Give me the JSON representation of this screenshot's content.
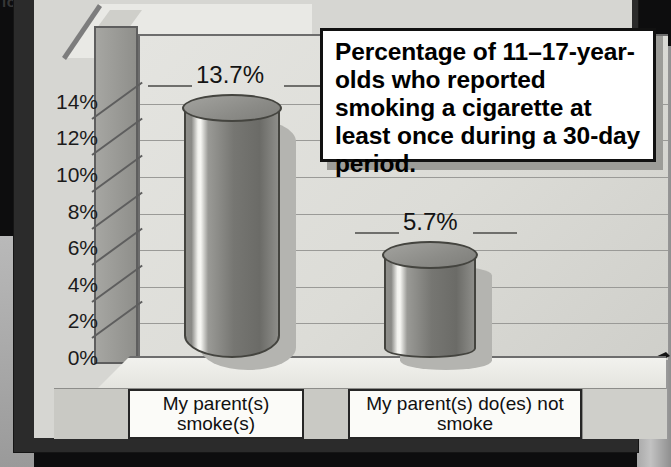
{
  "figure": {
    "cropped_text_fragment": "ion",
    "callout_title": "Percentage of 11–17-year-olds who reported smoking a cigarette at least once during a 30-day period."
  },
  "chart_data": {
    "type": "bar",
    "title": "Percentage of 11–17-year-olds who reported smoking a cigarette at least once during a 30-day period.",
    "subtitle": "",
    "xlabel": "",
    "ylabel": "",
    "categories": [
      "My parent(s) smoke(s)",
      "My parent(s) do(es) not smoke"
    ],
    "values": [
      13.7,
      5.7
    ],
    "data_labels": [
      "13.7%",
      "5.7%"
    ],
    "ylim": [
      0,
      15
    ],
    "yticks": [
      0,
      2,
      4,
      6,
      8,
      10,
      12,
      14
    ],
    "ytick_labels": [
      "0%",
      "2%",
      "4%",
      "6%",
      "8%",
      "10%",
      "12%",
      "14%"
    ],
    "grid": true,
    "legend": false,
    "style": "3d-cylinder-bars",
    "colors": {
      "bar": "#7a7a76",
      "bar_highlight": "#f7f7f3",
      "plot_background": "#dedeD9",
      "gridline": "#9a9a97",
      "frame": "#2b2b2b",
      "callout_background": "#ffffff",
      "text": "#141414"
    }
  }
}
